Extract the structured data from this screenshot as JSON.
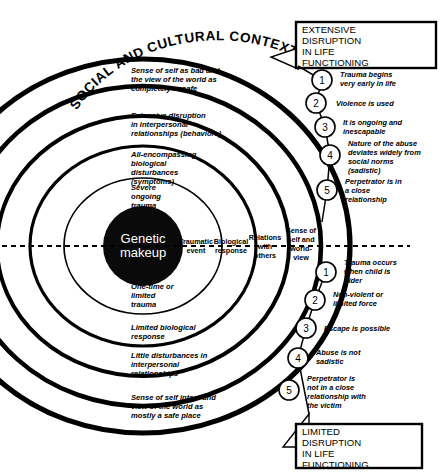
{
  "figure": {
    "arc_title": "SOCIAL AND CULTURAL CONTEXT",
    "core_line1": "Genetic",
    "core_line2": "makeup"
  },
  "axis_labels": [
    {
      "lines": [
        "Traumatic",
        "event"
      ]
    },
    {
      "lines": [
        "Biological",
        "response"
      ]
    },
    {
      "lines": [
        "Relations",
        "with",
        "others"
      ]
    },
    {
      "lines": [
        "Sense of",
        "self and",
        "world-",
        "view"
      ]
    }
  ],
  "upper_rings": [
    {
      "lines": [
        "Sense of self as bad and",
        "the view of the world as",
        "completely unsafe"
      ]
    },
    {
      "lines": [
        "Extensive disruption",
        "in interpersonal",
        "relationships (behaviors)"
      ]
    },
    {
      "lines": [
        "All-encompassing",
        "biological",
        "disturbances",
        "(symptoms)"
      ]
    },
    {
      "lines": [
        "Severe",
        "ongoing",
        "trauma"
      ]
    }
  ],
  "lower_rings": [
    {
      "lines": [
        "One-time or",
        "limited",
        "trauma"
      ]
    },
    {
      "lines": [
        "Limited biological",
        "response"
      ]
    },
    {
      "lines": [
        "Little disturbances in",
        "interpersonal",
        "relationships"
      ]
    },
    {
      "lines": [
        "Sense of self intact and",
        "view of the world as",
        "mostly a safe place"
      ]
    }
  ],
  "top_box": {
    "lines": [
      "EXTENSIVE",
      "DISRUPTION",
      "IN LIFE",
      "FUNCTIONING"
    ]
  },
  "bottom_box": {
    "lines": [
      "LIMITED",
      "DISRUPTION",
      "IN LIFE",
      "FUNCTIONING"
    ]
  },
  "top_items": [
    {
      "number": "1",
      "lines": [
        "Trauma begins",
        "very early in life"
      ]
    },
    {
      "number": "2",
      "lines": [
        "Violence is used"
      ]
    },
    {
      "number": "3",
      "lines": [
        "It is ongoing and",
        "inescapable"
      ]
    },
    {
      "number": "4",
      "lines": [
        "Nature of the abuse",
        "deviates widely from",
        "social norms",
        "(sadistic)"
      ]
    },
    {
      "number": "5",
      "lines": [
        "Perpetrator is in",
        "a close",
        "relationship"
      ]
    }
  ],
  "bottom_items": [
    {
      "number": "1",
      "lines": [
        "Trauma occurs",
        "when child is",
        "older"
      ]
    },
    {
      "number": "2",
      "lines": [
        "Non-violent or",
        "limited force"
      ]
    },
    {
      "number": "3",
      "lines": [
        "Escape is possible"
      ]
    },
    {
      "number": "4",
      "lines": [
        "Abuse is not",
        "sadistic"
      ]
    },
    {
      "number": "5",
      "lines": [
        "Perpetrator is",
        "not in a close",
        "relationship with",
        "the victim"
      ]
    }
  ],
  "colors": {
    "ink": "#000000",
    "paper": "#ffffff",
    "core_fill": "#0a0a0a"
  }
}
